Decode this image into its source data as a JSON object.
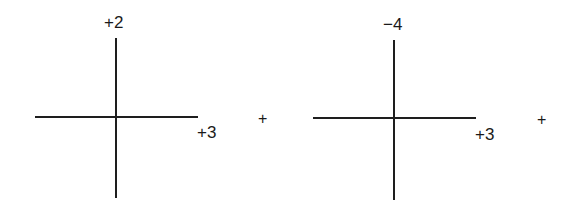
{
  "diagram": {
    "type": "sum of vector axes",
    "panels": [
      {
        "id": "left",
        "vertical_label": "+2",
        "horizontal_label": "+3",
        "operator_after": "+"
      },
      {
        "id": "right",
        "vertical_label": "−4",
        "horizontal_label": "+3",
        "operator_after": "+"
      }
    ],
    "colors": {
      "line": "#1e1e1e",
      "text": "#1a1a1a",
      "background": "#ffffff"
    }
  }
}
